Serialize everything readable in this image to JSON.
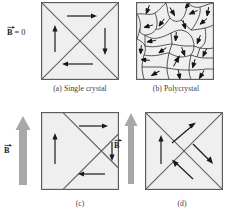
{
  "figure": {
    "title_present": false,
    "background": "#ffffff",
    "panel_fill": "#efefef",
    "panel_stroke": "#555555",
    "arrow_color": "#1a1a1a",
    "field_arrow_color": "#a8a8a8",
    "grain_stroke": "#3a3a3a"
  },
  "panels": [
    {
      "id": "a",
      "caption": "(a)  Single crystal",
      "field_label": "B = 0",
      "field_symbol": "B",
      "field_value": "0",
      "has_field_arrow": false,
      "description": "single crystal with four closure domains",
      "domain_arrows": [
        {
          "dir": "right"
        },
        {
          "dir": "down"
        },
        {
          "dir": "left"
        },
        {
          "dir": "up"
        }
      ]
    },
    {
      "id": "b",
      "caption": "(b)  Polycrystal",
      "field_label": "",
      "has_field_arrow": false,
      "description": "polycrystal with randomly oriented grains",
      "grain_count": 22
    },
    {
      "id": "c",
      "caption": "(c)",
      "field_label": "B",
      "field_symbol": "B",
      "has_field_arrow": true,
      "description": "domain walls shifted, favourable domain grows",
      "domain_arrows": [
        {
          "dir": "right"
        },
        {
          "dir": "down"
        },
        {
          "dir": "left"
        },
        {
          "dir": "up"
        }
      ]
    },
    {
      "id": "d",
      "caption": "(d)",
      "field_label": "B",
      "field_symbol": "B",
      "has_field_arrow": true,
      "description": "domain moments rotated toward the field",
      "domain_arrows": [
        {
          "dir": "up-right"
        },
        {
          "dir": "down-right"
        },
        {
          "dir": "up-left"
        },
        {
          "dir": "up"
        }
      ]
    }
  ]
}
